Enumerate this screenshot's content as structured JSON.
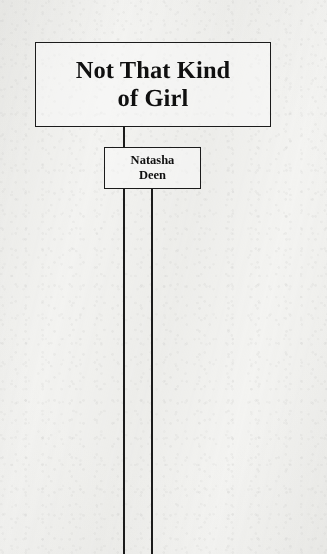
{
  "diagram": {
    "type": "hierarchy-tree",
    "background_color": "#f4f4f2",
    "line_color": "#1b1b1b",
    "text_color": "#101010",
    "nodes": [
      {
        "id": "title",
        "name": "title-node",
        "text": "Not That Kind\nof Girl",
        "line1": "Not That Kind",
        "line2": "of Girl"
      },
      {
        "id": "author",
        "name": "author-node",
        "text": "Natasha\nDeen",
        "line1": "Natasha",
        "line2": "Deen"
      }
    ],
    "connectors": [
      {
        "id": "title-to-author",
        "from": "title",
        "to": "author"
      },
      {
        "id": "author-branch-left",
        "from": "author",
        "to": ""
      },
      {
        "id": "author-branch-right",
        "from": "author",
        "to": ""
      }
    ]
  }
}
